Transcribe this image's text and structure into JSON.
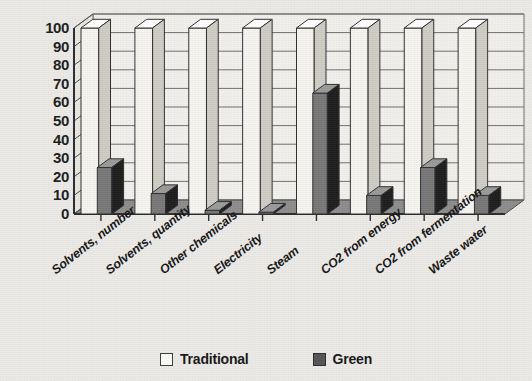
{
  "chart_data": {
    "type": "bar",
    "title": "",
    "subtitle": "",
    "xlabel": "",
    "ylabel": "",
    "ylim": [
      0,
      100
    ],
    "ytick_step": 10,
    "yticks": [
      0,
      10,
      20,
      30,
      40,
      50,
      60,
      70,
      80,
      90,
      100
    ],
    "grid": true,
    "grid_axis": "y",
    "legend_position": "bottom",
    "three_d": true,
    "categories": [
      "Solvents, number",
      "Solvents, quantity",
      "Other chemicals",
      "Electricity",
      "Steam",
      "CO2 from energy",
      "CO2 from fermentation",
      "Waste water"
    ],
    "series": [
      {
        "name": "Traditional",
        "color": "#f5f3ee",
        "values": [
          100,
          100,
          100,
          100,
          100,
          100,
          100,
          100
        ]
      },
      {
        "name": "Green",
        "color": "#444444",
        "values": [
          25,
          11,
          2,
          1,
          65,
          10,
          25,
          10
        ]
      }
    ]
  },
  "legend": {
    "items": [
      {
        "label": "Traditional",
        "swatch": "hollow-square"
      },
      {
        "label": "Green",
        "swatch": "filled-square"
      }
    ]
  },
  "colors": {
    "background": "#eceae6",
    "plot_floor": "#8c8c8c",
    "plot_back": "#f2f0ec",
    "axis": "#2b2b2b",
    "traditional_front": "#f6f4ef",
    "traditional_side": "#cfccc4",
    "green_front": "#777777",
    "green_side": "#1d1d1d"
  }
}
